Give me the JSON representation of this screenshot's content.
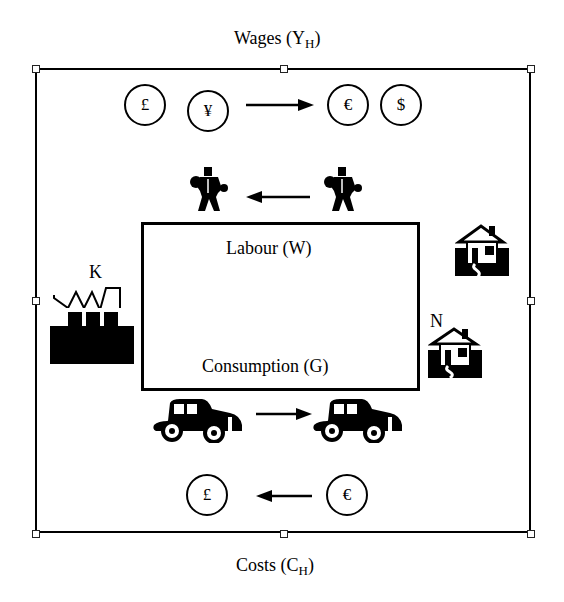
{
  "diagram": {
    "top_label": {
      "text": "Wages (Y",
      "sub": "H",
      "close": ")"
    },
    "bottom_label": {
      "text": "Costs (C",
      "sub": "H",
      "close": ")"
    },
    "inner_box": {
      "top_text": "Labour (W)",
      "bottom_text": "Consumption (G)"
    },
    "factory_label": "K",
    "house_label": "N",
    "top_flow": {
      "from_coins": [
        "£",
        "¥"
      ],
      "to_coins": [
        "€",
        "$"
      ],
      "arrow_direction": "right"
    },
    "labour_flow": {
      "icons": [
        "worker-icon",
        "worker-icon"
      ],
      "arrow_direction": "left"
    },
    "consumption_flow": {
      "icons": [
        "car-icon",
        "car-icon"
      ],
      "arrow_direction": "right"
    },
    "bottom_flow": {
      "from_coin": "€",
      "to_coin": "£",
      "arrow_direction": "left"
    },
    "icons": [
      "factory-icon",
      "house-icon",
      "house-icon"
    ]
  }
}
